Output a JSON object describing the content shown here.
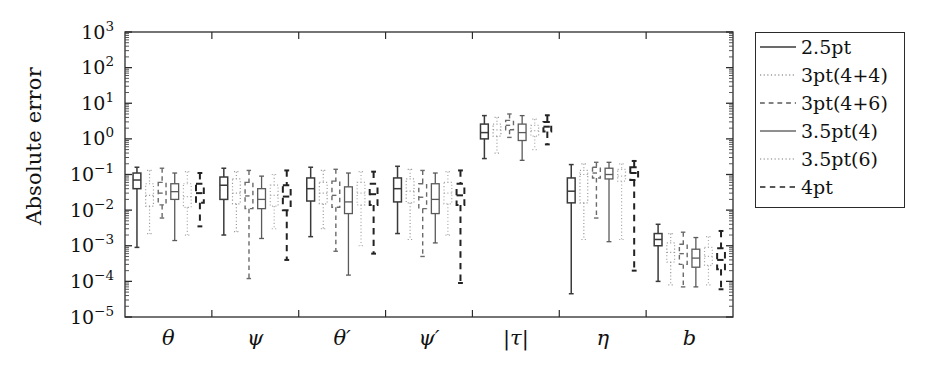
{
  "chart_data": {
    "type": "box",
    "title": "",
    "xlabel": "",
    "ylabel": "Absolute error",
    "yscale": "log",
    "ylim": [
      1e-05,
      1000.0
    ],
    "ytick_labels": [
      "10^3",
      "10^2",
      "10^1",
      "10^0",
      "10^-1",
      "10^-2",
      "10^-3",
      "10^-4",
      "10^-5"
    ],
    "ytick_values": [
      1000,
      100,
      10,
      1,
      0.1,
      0.01,
      0.001,
      0.0001,
      1e-05
    ],
    "categories": [
      "θ",
      "ψ",
      "θ′",
      "ψ′",
      "|τ|",
      "η",
      "b"
    ],
    "grid": false,
    "legend_position": "right-outside",
    "series": [
      {
        "name": "2.5pt",
        "style": "solid",
        "color": "#3a3a3a",
        "width": 1.5
      },
      {
        "name": "3pt(4+4)",
        "style": "dotted",
        "color": "#9a9a9a",
        "width": 1.2
      },
      {
        "name": "3pt(4+6)",
        "style": "dashed",
        "color": "#6a6a6a",
        "width": 1.4
      },
      {
        "name": "3.5pt(4)",
        "style": "solid",
        "color": "#5a5a5a",
        "width": 1.3
      },
      {
        "name": "3.5pt(6)",
        "style": "dotted",
        "color": "#aaaaaa",
        "width": 1.2
      },
      {
        "name": "4pt",
        "style": "dashed",
        "color": "#222222",
        "width": 2.0
      }
    ],
    "boxes": [
      {
        "category": "θ",
        "series": "2.5pt",
        "whisker_low": 0.0009,
        "q1": 0.04,
        "median": 0.07,
        "q3": 0.11,
        "whisker_high": 0.16
      },
      {
        "category": "θ",
        "series": "3pt(4+4)",
        "whisker_low": 0.0022,
        "q1": 0.013,
        "median": 0.026,
        "q3": 0.055,
        "whisker_high": 0.13
      },
      {
        "category": "θ",
        "series": "3pt(4+6)",
        "whisker_low": 0.006,
        "q1": 0.014,
        "median": 0.03,
        "q3": 0.06,
        "whisker_high": 0.15
      },
      {
        "category": "θ",
        "series": "3.5pt(4)",
        "whisker_low": 0.0014,
        "q1": 0.02,
        "median": 0.033,
        "q3": 0.055,
        "whisker_high": 0.11
      },
      {
        "category": "θ",
        "series": "3.5pt(6)",
        "whisker_low": 0.002,
        "q1": 0.012,
        "median": 0.024,
        "q3": 0.055,
        "whisker_high": 0.12
      },
      {
        "category": "θ",
        "series": "4pt",
        "whisker_low": 0.0035,
        "q1": 0.016,
        "median": 0.03,
        "q3": 0.055,
        "whisker_high": 0.11
      },
      {
        "category": "ψ",
        "series": "2.5pt",
        "whisker_low": 0.002,
        "q1": 0.02,
        "median": 0.05,
        "q3": 0.085,
        "whisker_high": 0.15
      },
      {
        "category": "ψ",
        "series": "3pt(4+4)",
        "whisker_low": 0.0025,
        "q1": 0.015,
        "median": 0.03,
        "q3": 0.075,
        "whisker_high": 0.12
      },
      {
        "category": "ψ",
        "series": "3pt(4+6)",
        "whisker_low": 0.00012,
        "q1": 0.011,
        "median": 0.025,
        "q3": 0.06,
        "whisker_high": 0.13
      },
      {
        "category": "ψ",
        "series": "3.5pt(4)",
        "whisker_low": 0.0016,
        "q1": 0.011,
        "median": 0.02,
        "q3": 0.04,
        "whisker_high": 0.09
      },
      {
        "category": "ψ",
        "series": "3.5pt(6)",
        "whisker_low": 0.003,
        "q1": 0.013,
        "median": 0.026,
        "q3": 0.05,
        "whisker_high": 0.1
      },
      {
        "category": "ψ",
        "series": "4pt",
        "whisker_low": 0.0004,
        "q1": 0.01,
        "median": 0.024,
        "q3": 0.05,
        "whisker_high": 0.13
      },
      {
        "category": "θ′",
        "series": "2.5pt",
        "whisker_low": 0.0018,
        "q1": 0.018,
        "median": 0.04,
        "q3": 0.08,
        "whisker_high": 0.16
      },
      {
        "category": "θ′",
        "series": "3pt(4+4)",
        "whisker_low": 0.003,
        "q1": 0.015,
        "median": 0.03,
        "q3": 0.06,
        "whisker_high": 0.13
      },
      {
        "category": "θ′",
        "series": "3pt(4+6)",
        "whisker_low": 0.0007,
        "q1": 0.012,
        "median": 0.026,
        "q3": 0.065,
        "whisker_high": 0.14
      },
      {
        "category": "θ′",
        "series": "3.5pt(4)",
        "whisker_low": 0.00015,
        "q1": 0.008,
        "median": 0.017,
        "q3": 0.045,
        "whisker_high": 0.11
      },
      {
        "category": "θ′",
        "series": "3.5pt(6)",
        "whisker_low": 0.001,
        "q1": 0.014,
        "median": 0.03,
        "q3": 0.06,
        "whisker_high": 0.12
      },
      {
        "category": "θ′",
        "series": "4pt",
        "whisker_low": 0.0006,
        "q1": 0.014,
        "median": 0.028,
        "q3": 0.055,
        "whisker_high": 0.12
      },
      {
        "category": "ψ′",
        "series": "2.5pt",
        "whisker_low": 0.0022,
        "q1": 0.017,
        "median": 0.04,
        "q3": 0.08,
        "whisker_high": 0.17
      },
      {
        "category": "ψ′",
        "series": "3pt(4+4)",
        "whisker_low": 0.0015,
        "q1": 0.016,
        "median": 0.034,
        "q3": 0.075,
        "whisker_high": 0.14
      },
      {
        "category": "ψ′",
        "series": "3pt(4+6)",
        "whisker_low": 0.0005,
        "q1": 0.011,
        "median": 0.023,
        "q3": 0.055,
        "whisker_high": 0.13
      },
      {
        "category": "ψ′",
        "series": "3.5pt(4)",
        "whisker_low": 0.0012,
        "q1": 0.008,
        "median": 0.02,
        "q3": 0.055,
        "whisker_high": 0.11
      },
      {
        "category": "ψ′",
        "series": "3.5pt(6)",
        "whisker_low": 0.002,
        "q1": 0.015,
        "median": 0.03,
        "q3": 0.06,
        "whisker_high": 0.12
      },
      {
        "category": "ψ′",
        "series": "4pt",
        "whisker_low": 9e-05,
        "q1": 0.014,
        "median": 0.026,
        "q3": 0.055,
        "whisker_high": 0.13
      },
      {
        "category": "|τ|",
        "series": "2.5pt",
        "whisker_low": 0.28,
        "q1": 1.0,
        "median": 1.5,
        "q3": 2.6,
        "whisker_high": 4.5
      },
      {
        "category": "|τ|",
        "series": "3pt(4+4)",
        "whisker_low": 0.4,
        "q1": 1.2,
        "median": 1.8,
        "q3": 2.6,
        "whisker_high": 4.0
      },
      {
        "category": "|τ|",
        "series": "3pt(4+6)",
        "whisker_low": 1.1,
        "q1": 1.8,
        "median": 2.4,
        "q3": 3.3,
        "whisker_high": 5.0
      },
      {
        "category": "|τ|",
        "series": "3.5pt(4)",
        "whisker_low": 0.25,
        "q1": 0.9,
        "median": 1.5,
        "q3": 2.6,
        "whisker_high": 4.5
      },
      {
        "category": "|τ|",
        "series": "3.5pt(6)",
        "whisker_low": 0.5,
        "q1": 1.2,
        "median": 1.7,
        "q3": 2.4,
        "whisker_high": 3.6
      },
      {
        "category": "|τ|",
        "series": "4pt",
        "whisker_low": 0.7,
        "q1": 1.6,
        "median": 2.2,
        "q3": 3.0,
        "whisker_high": 4.6
      },
      {
        "category": "η",
        "series": "2.5pt",
        "whisker_low": 4.5e-05,
        "q1": 0.016,
        "median": 0.034,
        "q3": 0.08,
        "whisker_high": 0.19
      },
      {
        "category": "η",
        "series": "3pt(4+4)",
        "whisker_low": 0.0015,
        "q1": 0.016,
        "median": 0.1,
        "q3": 0.13,
        "whisker_high": 0.2
      },
      {
        "category": "η",
        "series": "3pt(4+6)",
        "whisker_low": 0.006,
        "q1": 0.08,
        "median": 0.11,
        "q3": 0.16,
        "whisker_high": 0.22
      },
      {
        "category": "η",
        "series": "3.5pt(4)",
        "whisker_low": 0.0013,
        "q1": 0.075,
        "median": 0.1,
        "q3": 0.15,
        "whisker_high": 0.22
      },
      {
        "category": "η",
        "series": "3.5pt(6)",
        "whisker_low": 0.0015,
        "q1": 0.065,
        "median": 0.09,
        "q3": 0.14,
        "whisker_high": 0.2
      },
      {
        "category": "η",
        "series": "4pt",
        "whisker_low": 0.0002,
        "q1": 0.07,
        "median": 0.11,
        "q3": 0.16,
        "whisker_high": 0.24
      },
      {
        "category": "b",
        "series": "2.5pt",
        "whisker_low": 0.0001,
        "q1": 0.001,
        "median": 0.0015,
        "q3": 0.0022,
        "whisker_high": 0.004
      },
      {
        "category": "b",
        "series": "3pt(4+4)",
        "whisker_low": 8e-05,
        "q1": 0.00035,
        "median": 0.00065,
        "q3": 0.0012,
        "whisker_high": 0.0022
      },
      {
        "category": "b",
        "series": "3pt(4+6)",
        "whisker_low": 7e-05,
        "q1": 0.0003,
        "median": 0.0006,
        "q3": 0.0011,
        "whisker_high": 0.0024
      },
      {
        "category": "b",
        "series": "3.5pt(4)",
        "whisker_low": 7e-05,
        "q1": 0.00025,
        "median": 0.00045,
        "q3": 0.0008,
        "whisker_high": 0.0017
      },
      {
        "category": "b",
        "series": "3.5pt(6)",
        "whisker_low": 8e-05,
        "q1": 0.00028,
        "median": 0.0005,
        "q3": 0.0009,
        "whisker_high": 0.0018
      },
      {
        "category": "b",
        "series": "4pt",
        "whisker_low": 6e-05,
        "q1": 0.00022,
        "median": 0.0004,
        "q3": 0.00085,
        "whisker_high": 0.0026
      }
    ]
  },
  "axes": {
    "y_label": "Absolute error",
    "y_ticks": [
      {
        "exp": "3"
      },
      {
        "exp": "2"
      },
      {
        "exp": "1"
      },
      {
        "exp": "0"
      },
      {
        "exp": "−1"
      },
      {
        "exp": "−2"
      },
      {
        "exp": "−3"
      },
      {
        "exp": "−4"
      },
      {
        "exp": "−5"
      }
    ],
    "y_mantissa": "10",
    "x_ticks": [
      "θ",
      "ψ",
      "θ′",
      "ψ′",
      "|τ|",
      "η",
      "b"
    ]
  },
  "legend": {
    "items": [
      {
        "label": "2.5pt",
        "style": "solid",
        "color": "#3a3a3a",
        "width": 1.6
      },
      {
        "label": "3pt(4+4)",
        "style": "dotted",
        "color": "#9a9a9a",
        "width": 1.3
      },
      {
        "label": "3pt(4+6)",
        "style": "dashed",
        "color": "#5a5a5a",
        "width": 1.5
      },
      {
        "label": "3.5pt(4)",
        "style": "solid",
        "color": "#6a6a6a",
        "width": 1.3
      },
      {
        "label": "3.5pt(6)",
        "style": "dotted",
        "color": "#a5a5a5",
        "width": 1.3
      },
      {
        "label": "4pt",
        "style": "dashed",
        "color": "#222222",
        "width": 1.7
      }
    ]
  }
}
